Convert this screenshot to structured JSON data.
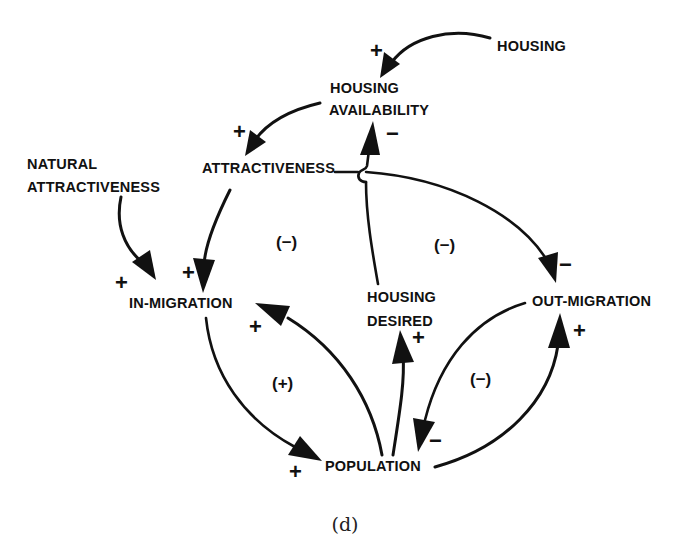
{
  "figure": {
    "caption": "(d)",
    "type": "causal-loop-diagram",
    "colors": {
      "ink": "#111111",
      "background": "#ffffff"
    }
  },
  "nodes": {
    "housing": {
      "lines": [
        "HOUSING"
      ]
    },
    "housing_availability": {
      "lines": [
        "HOUSING",
        "AVAILABILITY"
      ]
    },
    "attractiveness": {
      "lines": [
        "ATTRACTIVENESS"
      ]
    },
    "natural_attractiveness": {
      "lines": [
        "NATURAL",
        "ATTRACTIVENESS"
      ]
    },
    "in_migration": {
      "lines": [
        "IN-MIGRATION"
      ]
    },
    "housing_desired": {
      "lines": [
        "HOUSING",
        "DESIRED"
      ]
    },
    "out_migration": {
      "lines": [
        "OUT-MIGRATION"
      ]
    },
    "population": {
      "lines": [
        "POPULATION"
      ]
    }
  },
  "links": [
    {
      "from": "HOUSING",
      "to": "HOUSING AVAILABILITY",
      "polarity": "+"
    },
    {
      "from": "HOUSING AVAILABILITY",
      "to": "ATTRACTIVENESS",
      "polarity": "+"
    },
    {
      "from": "HOUSING DESIRED",
      "to": "HOUSING AVAILABILITY",
      "polarity": "−"
    },
    {
      "from": "ATTRACTIVENESS",
      "to": "IN-MIGRATION",
      "polarity": "+"
    },
    {
      "from": "ATTRACTIVENESS",
      "to": "OUT-MIGRATION",
      "polarity": "−"
    },
    {
      "from": "NATURAL ATTRACTIVENESS",
      "to": "IN-MIGRATION",
      "polarity": "+"
    },
    {
      "from": "POPULATION",
      "to": "IN-MIGRATION",
      "polarity": "+"
    },
    {
      "from": "IN-MIGRATION",
      "to": "POPULATION",
      "polarity": "+"
    },
    {
      "from": "POPULATION",
      "to": "HOUSING DESIRED",
      "polarity": "+"
    },
    {
      "from": "OUT-MIGRATION",
      "to": "POPULATION",
      "polarity": "−"
    },
    {
      "from": "POPULATION",
      "to": "OUT-MIGRATION",
      "polarity": "+"
    }
  ],
  "polarity_marks": {
    "housing_to_availability": "+",
    "availability_to_attractiveness": "+",
    "desired_to_availability": "−",
    "natural_to_inmigration": "+",
    "attractiveness_to_inmigration": "+",
    "attractiveness_to_outmigration": "−",
    "population_to_inmigration": "+",
    "population_to_desired": "+",
    "population_to_outmigration": "+",
    "inmigration_to_population": "+",
    "outmigration_to_population": "−"
  },
  "loops": {
    "attractiveness_inmigration_loop": "(−)",
    "attractiveness_outmigration_loop": "(−)",
    "inmigration_population_loop": "(+)",
    "outmigration_population_loop": "(−)"
  }
}
